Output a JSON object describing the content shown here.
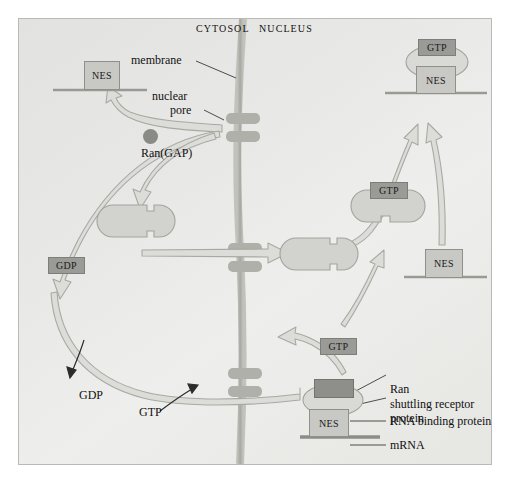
{
  "figure": {
    "compartments": {
      "left": "CYTOSOL",
      "right": "NUCLEUS"
    },
    "colors": {
      "background": "#e8e8e6",
      "membrane": "#b3b3ae",
      "pore": "#b0b0ab",
      "arrow_fill": "#dcdcd8",
      "arrow_stroke": "#a9a9a4",
      "light_box": "#c8c8c4",
      "dark_box": "#8e8e8a",
      "receptor": "#d2d2ce",
      "text": "#111111"
    }
  },
  "annotations": [
    {
      "name": "membrane",
      "text": "membrane"
    },
    {
      "name": "nuclear-pore",
      "text": "nuclear pore",
      "line1": "nuclear",
      "line2": "pore"
    },
    {
      "name": "ran-gap",
      "text": "Ran(GAP)"
    },
    {
      "name": "gdp-release",
      "text": "GDP"
    },
    {
      "name": "gtp-load",
      "text": "GTP"
    }
  ],
  "complexes": {
    "cytosol_mrna_nes": {
      "nes": "NES"
    },
    "nucleus_export_complex": {
      "gtp": "GTP",
      "nes": "NES"
    },
    "nucleus_receptor_gtp": {
      "gtp": "GTP"
    },
    "nucleus_mrna_nes": {
      "nes": "NES"
    },
    "cytosol_gdp": {
      "gdp": "GDP"
    },
    "cytosol_gtp": {
      "gtp": "GTP"
    }
  },
  "legend": {
    "items": [
      {
        "key": "ran",
        "label": "Ran"
      },
      {
        "key": "shuttling-receptor-protein",
        "label": "shuttling receptor",
        "label2": "protein"
      },
      {
        "key": "rna-binding-protein",
        "label": "RNA binding protein",
        "box": "NES"
      },
      {
        "key": "mrna",
        "label": "mRNA"
      }
    ]
  }
}
